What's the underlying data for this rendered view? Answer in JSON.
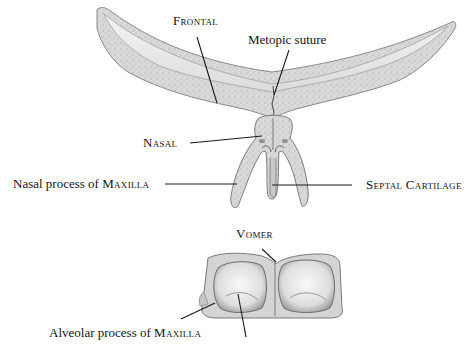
{
  "figure": {
    "type": "anatomical-illustration",
    "colors": {
      "background": "#ffffff",
      "bone_fill": "#e4e4e4",
      "bone_cortex": "#cfcfcf",
      "bone_outline": "#8a8a8a",
      "cavity": "#f1f1f1",
      "leader_line": "#1a1a1a",
      "text": "#141414"
    }
  },
  "labels": {
    "frontal": "Frontal",
    "metopic_suture": "Metopic suture",
    "nasal": "Nasal",
    "nasal_process_prefix": "Nasal process of ",
    "nasal_process_bone": "Maxilla",
    "septal_cartilage": "Septal Cartilage",
    "vomer": "Vomer",
    "alveolar_process_prefix": "Alveolar process of ",
    "alveolar_process_bone": "Maxilla"
  },
  "structures": [
    {
      "name": "Frontal bone",
      "region": "top arc"
    },
    {
      "name": "Metopic suture",
      "region": "midline of frontal"
    },
    {
      "name": "Nasal bone",
      "region": "center below frontal"
    },
    {
      "name": "Nasal process of maxilla",
      "region": "left leg of Y"
    },
    {
      "name": "Septal cartilage",
      "region": "center stem of Y"
    },
    {
      "name": "Vomer",
      "region": "midline of lower block"
    },
    {
      "name": "Alveolar process of maxilla",
      "region": "lower block"
    }
  ]
}
